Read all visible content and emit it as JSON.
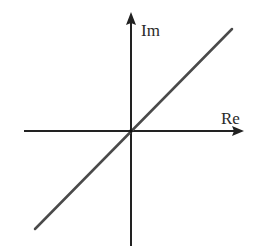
{
  "diagram": {
    "type": "complex-plane",
    "colors": {
      "background": "#ffffff",
      "axis": "#222222",
      "line": "#4a4a4a",
      "text": "#2a2a2a"
    },
    "origin": {
      "x": 131,
      "y": 131
    },
    "axes": {
      "horizontal": {
        "label": "Re",
        "x_start": 24,
        "x_end": 244,
        "y": 131
      },
      "vertical": {
        "label": "Im",
        "y_start": 246,
        "y_end": 12,
        "x": 131
      }
    },
    "line": {
      "x1": 35,
      "y1": 229,
      "x2": 232,
      "y2": 29
    },
    "labels": {
      "re": "Re",
      "im": "Im"
    }
  }
}
